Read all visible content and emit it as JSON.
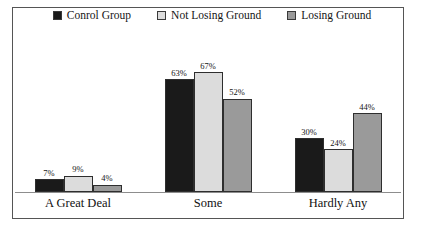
{
  "legend": {
    "items": [
      {
        "label": "Conrol Group",
        "color": "#1a1a1a"
      },
      {
        "label": "Not Losing Ground",
        "color": "#dcdcdc"
      },
      {
        "label": "Losing Ground",
        "color": "#9a9a9a"
      }
    ]
  },
  "chart_data": {
    "type": "bar",
    "title": "",
    "subtitle": "",
    "xlabel": "",
    "ylabel": "",
    "ylim": [
      0,
      70
    ],
    "grid": false,
    "legend_position": "top",
    "value_suffix": "%",
    "categories": [
      "A Great Deal",
      "Some",
      "Hardly Any"
    ],
    "series": [
      {
        "name": "Conrol Group",
        "color": "#1a1a1a",
        "values": [
          7,
          63,
          30
        ],
        "labels": [
          "7%",
          "63%",
          "30%"
        ]
      },
      {
        "name": "Not Losing Ground",
        "color": "#dcdcdc",
        "values": [
          9,
          67,
          24
        ],
        "labels": [
          "9%",
          "67%",
          "24%"
        ]
      },
      {
        "name": "Losing Ground",
        "color": "#9a9a9a",
        "values": [
          4,
          52,
          44
        ],
        "labels": [
          "4%",
          "52%",
          "44%"
        ]
      }
    ]
  },
  "style": {
    "frame_color": "#555555",
    "baseline_color": "#8d8d8d",
    "bar_border_color": "#2e2e2e",
    "background": "#ffffff",
    "text_color": "#151515"
  }
}
